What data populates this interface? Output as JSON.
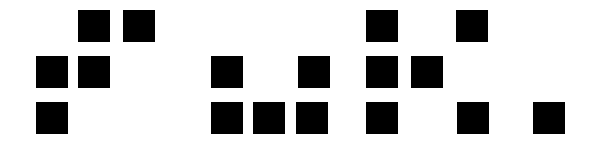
{
  "canvas": {
    "width": 595,
    "height": 144,
    "background_color": "#ffffff",
    "foreground_color": "#000000"
  },
  "pattern": {
    "block_size": 32,
    "row_y": [
      10,
      56,
      102
    ],
    "blocks": [
      {
        "name": "block-r1-c1",
        "x": 78,
        "y": 10,
        "w": 32,
        "h": 32
      },
      {
        "name": "block-r1-c2",
        "x": 123,
        "y": 10,
        "w": 32,
        "h": 32
      },
      {
        "name": "block-r1-c3",
        "x": 366,
        "y": 10,
        "w": 32,
        "h": 32
      },
      {
        "name": "block-r1-c4",
        "x": 456,
        "y": 10,
        "w": 32,
        "h": 32
      },
      {
        "name": "block-r2-c1",
        "x": 36,
        "y": 56,
        "w": 32,
        "h": 32
      },
      {
        "name": "block-r2-c2",
        "x": 78,
        "y": 56,
        "w": 32,
        "h": 32
      },
      {
        "name": "block-r2-c3",
        "x": 211,
        "y": 56,
        "w": 32,
        "h": 32
      },
      {
        "name": "block-r2-c4",
        "x": 298,
        "y": 56,
        "w": 32,
        "h": 32
      },
      {
        "name": "block-r2-c5",
        "x": 366,
        "y": 56,
        "w": 32,
        "h": 32
      },
      {
        "name": "block-r2-c6",
        "x": 411,
        "y": 56,
        "w": 32,
        "h": 32
      },
      {
        "name": "block-r3-c1",
        "x": 36,
        "y": 102,
        "w": 32,
        "h": 32
      },
      {
        "name": "block-r3-c2",
        "x": 211,
        "y": 102,
        "w": 32,
        "h": 32
      },
      {
        "name": "block-r3-c3",
        "x": 253,
        "y": 102,
        "w": 32,
        "h": 32
      },
      {
        "name": "block-r3-c4",
        "x": 296,
        "y": 102,
        "w": 32,
        "h": 32
      },
      {
        "name": "block-r3-c5",
        "x": 366,
        "y": 102,
        "w": 32,
        "h": 32
      },
      {
        "name": "block-r3-c6",
        "x": 457,
        "y": 102,
        "w": 32,
        "h": 32
      },
      {
        "name": "block-r3-c7",
        "x": 533,
        "y": 102,
        "w": 32,
        "h": 32
      }
    ]
  }
}
